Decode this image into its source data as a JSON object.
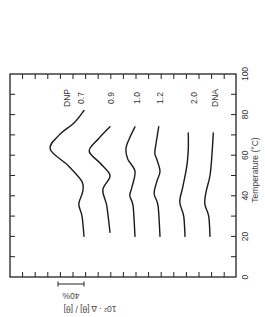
{
  "chart_data": {
    "type": "line",
    "orientation": "rotated-90-ccw",
    "title": "",
    "xlabel": "Temperature (°C)",
    "ylabel": "10² · Δ [θ] / [θ]",
    "xlim": [
      0,
      100
    ],
    "xticks": [
      "0",
      "20",
      "40",
      "60",
      "80",
      "100"
    ],
    "scale_bar": {
      "label": "40%",
      "value": 40
    },
    "grid": false,
    "legend": "inline-labels-at-curve-ends",
    "y_units": "percent change relative to each curve's baseline at ~20 °C (curves vertically offset)",
    "series": [
      {
        "name": "DNP 0.7",
        "label_lines": [
          "DNP",
          "0.7"
        ],
        "points": [
          [
            20,
            0
          ],
          [
            30,
            3
          ],
          [
            36,
            8
          ],
          [
            42,
            2
          ],
          [
            47,
            3
          ],
          [
            55,
            25
          ],
          [
            63,
            52
          ],
          [
            70,
            38
          ],
          [
            76,
            15
          ],
          [
            82,
            0
          ]
        ]
      },
      {
        "name": "0.9",
        "label_lines": [
          "0.9"
        ],
        "points": [
          [
            22,
            0
          ],
          [
            35,
            5
          ],
          [
            43,
            11
          ],
          [
            50,
            0
          ],
          [
            56,
            15
          ],
          [
            62,
            32
          ],
          [
            68,
            18
          ],
          [
            74,
            0
          ]
        ]
      },
      {
        "name": "1.0",
        "label_lines": [
          "1.0"
        ],
        "points": [
          [
            20,
            0
          ],
          [
            35,
            3
          ],
          [
            40,
            8
          ],
          [
            44,
            5
          ],
          [
            52,
            0
          ],
          [
            58,
            11
          ],
          [
            63,
            14
          ],
          [
            68,
            9
          ],
          [
            74,
            0
          ]
        ]
      },
      {
        "name": "1.2",
        "label_lines": [
          "1.2"
        ],
        "points": [
          [
            20,
            0
          ],
          [
            35,
            3
          ],
          [
            41,
            9
          ],
          [
            47,
            5
          ],
          [
            52,
            0
          ],
          [
            58,
            5
          ],
          [
            61,
            8
          ],
          [
            66,
            6
          ],
          [
            74,
            2
          ]
        ]
      },
      {
        "name": "2.0",
        "label_lines": [
          "2.0"
        ],
        "points": [
          [
            20,
            0
          ],
          [
            30,
            2
          ],
          [
            37,
            8
          ],
          [
            45,
            3
          ],
          [
            55,
            -3
          ],
          [
            63,
            -5
          ],
          [
            71,
            -5
          ]
        ]
      },
      {
        "name": "DNA",
        "label_lines": [
          "DNA"
        ],
        "points": [
          [
            20,
            0
          ],
          [
            30,
            2
          ],
          [
            36,
            8
          ],
          [
            42,
            6
          ],
          [
            50,
            0
          ],
          [
            60,
            -3
          ],
          [
            71,
            -5
          ]
        ]
      }
    ]
  }
}
